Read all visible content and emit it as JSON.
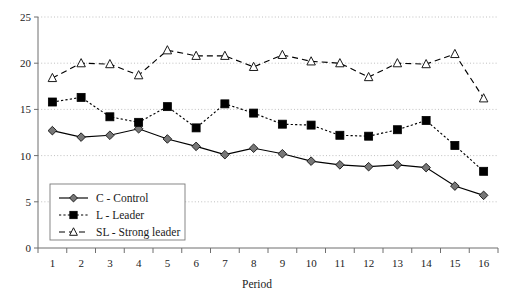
{
  "chart_data": {
    "type": "line",
    "title": "",
    "xlabel": "Period",
    "ylabel": "",
    "xlim": [
      0.5,
      16.5
    ],
    "ylim": [
      0,
      25
    ],
    "yticks": [
      0,
      5,
      10,
      15,
      20,
      25
    ],
    "grid": true,
    "legend_position": "lower-left-inside",
    "categories": [
      "1",
      "2",
      "3",
      "4",
      "5",
      "6",
      "7",
      "8",
      "9",
      "10",
      "11",
      "12",
      "13",
      "14",
      "15",
      "16"
    ],
    "x": [
      1,
      2,
      3,
      4,
      5,
      6,
      7,
      8,
      9,
      10,
      11,
      12,
      13,
      14,
      15,
      16
    ],
    "series": [
      {
        "name": "C - Control",
        "marker": "diamond-filled",
        "linestyle": "solid",
        "color": "#000000",
        "marker_fill": "#777777",
        "values": [
          12.7,
          12.0,
          12.2,
          12.9,
          11.8,
          11.0,
          10.1,
          10.8,
          10.2,
          9.4,
          9.0,
          8.8,
          9.0,
          8.7,
          6.7,
          5.7
        ]
      },
      {
        "name": "L - Leader",
        "marker": "square-filled",
        "linestyle": "dotted",
        "color": "#000000",
        "marker_fill": "#000000",
        "values": [
          15.8,
          16.3,
          14.2,
          13.6,
          15.3,
          13.0,
          15.6,
          14.6,
          13.4,
          13.3,
          12.2,
          12.1,
          12.8,
          13.8,
          11.1,
          8.3
        ]
      },
      {
        "name": "SL - Strong leader",
        "marker": "triangle-open",
        "linestyle": "dashed",
        "color": "#000000",
        "marker_fill": "#ffffff",
        "values": [
          18.4,
          20.0,
          19.9,
          18.7,
          21.4,
          20.8,
          20.8,
          19.6,
          20.9,
          20.2,
          20.0,
          18.5,
          20.0,
          19.9,
          21.0,
          16.2
        ]
      }
    ]
  },
  "axis": {
    "x_title": "Period",
    "y_tick_labels": [
      "0",
      "5",
      "10",
      "15",
      "20",
      "25"
    ],
    "x_tick_labels": [
      "1",
      "2",
      "3",
      "4",
      "5",
      "6",
      "7",
      "8",
      "9",
      "10",
      "11",
      "12",
      "13",
      "14",
      "15",
      "16"
    ]
  },
  "legend": {
    "entries": [
      {
        "label": "C - Control"
      },
      {
        "label": "L - Leader"
      },
      {
        "label": "SL - Strong leader"
      }
    ]
  }
}
